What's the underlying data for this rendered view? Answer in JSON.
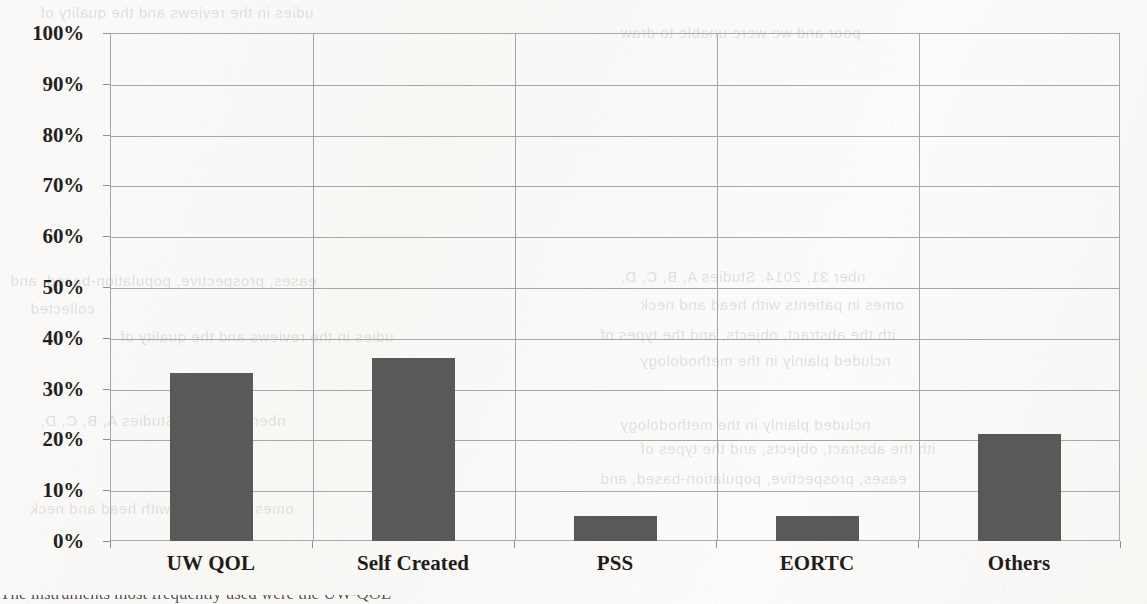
{
  "chart_data": {
    "type": "bar",
    "title": "",
    "xlabel": "",
    "ylabel": "",
    "categories": [
      "UW QOL",
      "Self Created",
      "PSS",
      "EORTC",
      "Others"
    ],
    "values": [
      33,
      36,
      5,
      5,
      21
    ],
    "value_labels": [
      "33%",
      "36%",
      "5%",
      "5%",
      "21%"
    ],
    "ylim": [
      0,
      100
    ],
    "ytick_values": [
      0,
      10,
      20,
      30,
      40,
      50,
      60,
      70,
      80,
      90,
      100
    ],
    "ytick_labels": [
      "0%",
      "10%",
      "20%",
      "30%",
      "40%",
      "50%",
      "60%",
      "70%",
      "80%",
      "90%",
      "100%"
    ],
    "grid": true,
    "grid_horizontal": true,
    "grid_vertical": true,
    "legend": false,
    "legend_position": "none",
    "series": [
      {
        "name": "Percentage of studies",
        "values": [
          33,
          36,
          5,
          5,
          21
        ]
      }
    ]
  },
  "colors": {
    "bar_fill": "#595959",
    "gridline": "#a6a6a6",
    "axis_line": "#a8a8a8",
    "tick_label": "#231f1e",
    "category_label": "#1f1c1b",
    "page_background": "#fbfaf8",
    "ghost_text": "#c9c9c4"
  },
  "axes": {
    "y_axis_name": "y-axis",
    "x_axis_name": "x-axis",
    "plot_area_name": "plot-area"
  },
  "ghost_text_bleedthrough": [
    "udies in the reviews and the quality of",
    "poor and we were unable to draw",
    "nber 31, 2014. Studies A, B, C, D,",
    "omes in patients with head and neck",
    "ith the abstract, objects, and the types of",
    "ncluded plainly in the methodology",
    "eases, prospective, population-based, and",
    "collected"
  ],
  "caption_remnant": "The instruments most frequently used were the UW-QOL"
}
